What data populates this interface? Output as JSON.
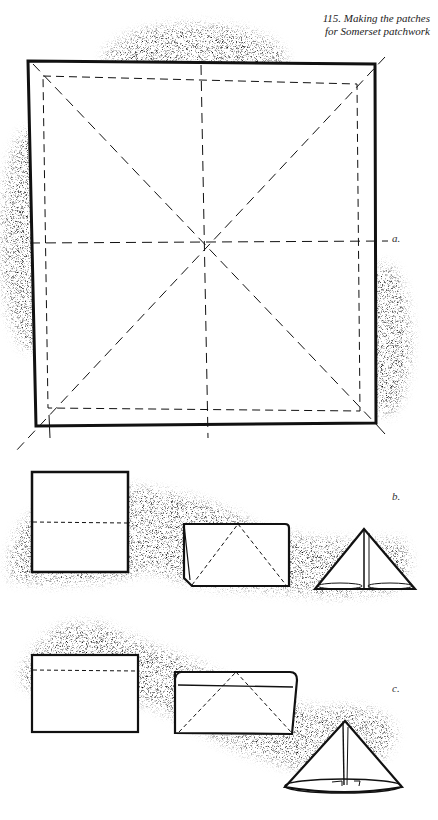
{
  "figure": {
    "caption_line1": "115.  Making the patches",
    "caption_line2": "for Somerset patchwork",
    "labels": {
      "a": "a.",
      "b": "b.",
      "c": "c."
    }
  },
  "colors": {
    "ink": "#111111",
    "shadow": "#555555",
    "paper": "#ffffff"
  }
}
